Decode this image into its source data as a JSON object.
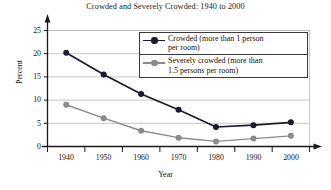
{
  "chart_data": {
    "type": "line",
    "title": "Crowded and Severely Crowded: 1940 to 2000",
    "xlabel": "Year",
    "ylabel": "Percent",
    "categories": [
      "1940",
      "1950",
      "1960",
      "1970",
      "1980",
      "1990",
      "2000"
    ],
    "x": [
      1940,
      1950,
      1960,
      1970,
      1980,
      1990,
      2000
    ],
    "series": [
      {
        "name": "Crowded (more than 1 person per room)",
        "legend_line1": "Crowded (more than 1 person",
        "legend_line2": "per room)",
        "color": "#1b1b2e",
        "values": [
          20.2,
          15.5,
          11.3,
          7.9,
          4.2,
          4.6,
          5.2
        ]
      },
      {
        "name": "Severely crowded (more than 1.5 persons per room)",
        "legend_line1": "Severely crowded (more than",
        "legend_line2": "1.5 persons per room)",
        "color": "#8a8a8a",
        "values": [
          9.0,
          6.1,
          3.4,
          1.9,
          1.1,
          1.7,
          2.3
        ]
      }
    ],
    "yticks": [
      0,
      5,
      10,
      15,
      20,
      25
    ],
    "ytick_labels": [
      "0",
      "5",
      "10",
      "15",
      "20",
      "25"
    ],
    "ylim": [
      0,
      25
    ],
    "grid": "horizontal",
    "legend_position": "upper right inside"
  },
  "axes": {
    "y_arrow": "up-arrow-icon",
    "x_arrow": "right-arrow-icon"
  }
}
